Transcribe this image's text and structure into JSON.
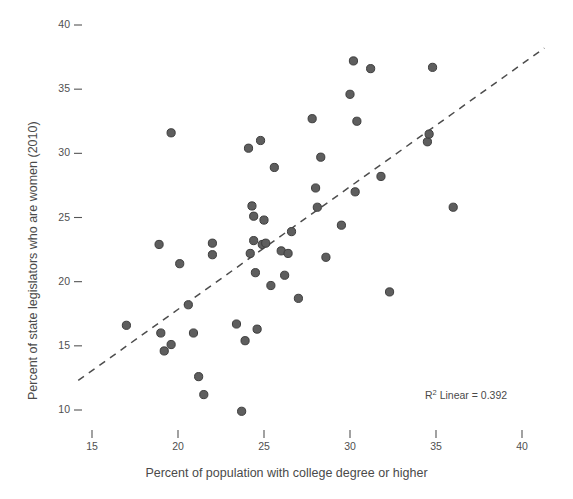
{
  "chart_data": {
    "type": "scatter",
    "title": "",
    "xlabel": "Percent of population with college degree or higher",
    "ylabel": "Percent of state legislators who are women (2010)",
    "xlim": [
      13.2,
      41.5
    ],
    "ylim": [
      8.7,
      41.2
    ],
    "xticks": [
      15,
      20,
      25,
      30,
      35,
      40
    ],
    "yticks": [
      10,
      15,
      20,
      25,
      30,
      35,
      40
    ],
    "xtick_labels": [
      "15",
      "20",
      "25",
      "30",
      "35",
      "40"
    ],
    "ytick_labels": [
      "10",
      "15",
      "20",
      "25",
      "30",
      "35",
      "40"
    ],
    "grid": false,
    "legend": null,
    "marker": {
      "shape": "circle",
      "fill": "#5e5e5e",
      "stroke": "#3d3d3d",
      "radius": 4.1
    },
    "points": [
      {
        "x": 19.6,
        "y": 31.6
      },
      {
        "x": 17.0,
        "y": 16.6
      },
      {
        "x": 18.9,
        "y": 22.9
      },
      {
        "x": 19.0,
        "y": 16.0
      },
      {
        "x": 19.2,
        "y": 14.6
      },
      {
        "x": 19.6,
        "y": 15.1
      },
      {
        "x": 20.1,
        "y": 21.4
      },
      {
        "x": 20.6,
        "y": 18.2
      },
      {
        "x": 20.9,
        "y": 16.0
      },
      {
        "x": 21.2,
        "y": 12.6
      },
      {
        "x": 21.5,
        "y": 11.2
      },
      {
        "x": 22.0,
        "y": 23.0
      },
      {
        "x": 22.0,
        "y": 22.1
      },
      {
        "x": 23.4,
        "y": 16.7
      },
      {
        "x": 23.7,
        "y": 9.9
      },
      {
        "x": 23.9,
        "y": 15.4
      },
      {
        "x": 24.1,
        "y": 30.4
      },
      {
        "x": 24.2,
        "y": 22.2
      },
      {
        "x": 24.3,
        "y": 25.9
      },
      {
        "x": 24.4,
        "y": 25.1
      },
      {
        "x": 24.4,
        "y": 23.2
      },
      {
        "x": 24.5,
        "y": 20.7
      },
      {
        "x": 24.6,
        "y": 16.3
      },
      {
        "x": 24.8,
        "y": 31.0
      },
      {
        "x": 24.9,
        "y": 22.9
      },
      {
        "x": 25.0,
        "y": 24.8
      },
      {
        "x": 25.1,
        "y": 23.0
      },
      {
        "x": 25.4,
        "y": 19.7
      },
      {
        "x": 25.6,
        "y": 28.9
      },
      {
        "x": 26.0,
        "y": 22.4
      },
      {
        "x": 26.2,
        "y": 20.5
      },
      {
        "x": 26.4,
        "y": 22.2
      },
      {
        "x": 26.6,
        "y": 23.9
      },
      {
        "x": 27.0,
        "y": 18.7
      },
      {
        "x": 27.8,
        "y": 32.7
      },
      {
        "x": 28.0,
        "y": 27.3
      },
      {
        "x": 28.1,
        "y": 25.8
      },
      {
        "x": 28.3,
        "y": 29.7
      },
      {
        "x": 28.6,
        "y": 21.9
      },
      {
        "x": 29.5,
        "y": 24.4
      },
      {
        "x": 30.0,
        "y": 34.6
      },
      {
        "x": 30.2,
        "y": 37.2
      },
      {
        "x": 30.3,
        "y": 27.0
      },
      {
        "x": 30.4,
        "y": 32.5
      },
      {
        "x": 31.2,
        "y": 36.6
      },
      {
        "x": 31.8,
        "y": 28.2
      },
      {
        "x": 32.3,
        "y": 19.2
      },
      {
        "x": 34.5,
        "y": 30.9
      },
      {
        "x": 34.6,
        "y": 31.5
      },
      {
        "x": 34.8,
        "y": 36.7
      },
      {
        "x": 36.0,
        "y": 25.8
      }
    ],
    "trendline": {
      "style": "dashed",
      "color": "#4d4d4d",
      "r_squared": 0.392,
      "label": "R",
      "label_sup": "2",
      "label_rest": " Linear = 0.392",
      "x_start": 14.2,
      "y_start": 12.3,
      "x_end": 41.3,
      "y_end": 38.2
    }
  },
  "annotations": {
    "top_clipped_text": ""
  }
}
